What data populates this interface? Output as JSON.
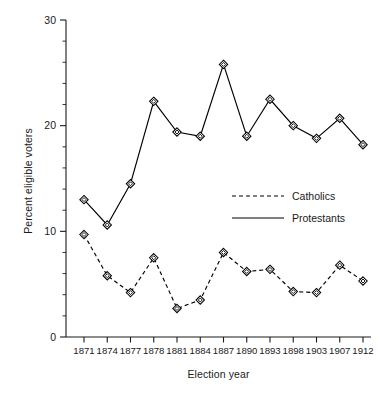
{
  "chart_data": {
    "type": "line",
    "title": "",
    "xlabel": "Election year",
    "ylabel": "Percent eligible voters",
    "categories": [
      "1871",
      "1874",
      "1877",
      "1878",
      "1881",
      "1884",
      "1887",
      "1890",
      "1893",
      "1898",
      "1903",
      "1907",
      "1912"
    ],
    "ylim": [
      0,
      30
    ],
    "yticks": [
      0,
      10,
      20,
      30
    ],
    "ytick_labels": [
      "0",
      "10",
      "20",
      "30"
    ],
    "yminor_step": 2,
    "grid": false,
    "legend_position": "center-right",
    "series": [
      {
        "name": "Catholics",
        "style": "dashed",
        "marker": "diamond",
        "color": "#000000",
        "values": [
          9.7,
          5.8,
          4.2,
          7.5,
          2.7,
          3.5,
          8.0,
          6.2,
          6.4,
          4.3,
          4.2,
          6.8,
          5.3
        ]
      },
      {
        "name": "Protestants",
        "style": "solid",
        "marker": "diamond",
        "color": "#000000",
        "values": [
          13.0,
          10.6,
          14.5,
          22.3,
          19.4,
          19.0,
          25.8,
          19.0,
          22.5,
          20.0,
          18.8,
          20.7,
          18.2
        ]
      }
    ]
  },
  "legend": {
    "items": [
      {
        "label": "Catholics",
        "style": "dashed"
      },
      {
        "label": "Protestants",
        "style": "solid"
      }
    ]
  },
  "axes": {
    "x_title": "Election year",
    "y_title": "Percent eligible voters"
  }
}
